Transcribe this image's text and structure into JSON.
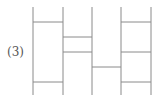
{
  "label": "(3)",
  "colors": {
    "line": "#8a8a8a"
  },
  "ladder": {
    "top": 7,
    "bottom": 95,
    "verticals_x": [
      33,
      63,
      92,
      121,
      151
    ],
    "rungs": [
      {
        "from": 0,
        "to": 1,
        "y": 22
      },
      {
        "from": 0,
        "to": 1,
        "y": 82
      },
      {
        "from": 1,
        "to": 2,
        "y": 37
      },
      {
        "from": 1,
        "to": 2,
        "y": 52
      },
      {
        "from": 2,
        "to": 3,
        "y": 67
      },
      {
        "from": 3,
        "to": 4,
        "y": 22
      },
      {
        "from": 3,
        "to": 4,
        "y": 52
      },
      {
        "from": 3,
        "to": 4,
        "y": 82
      }
    ]
  }
}
